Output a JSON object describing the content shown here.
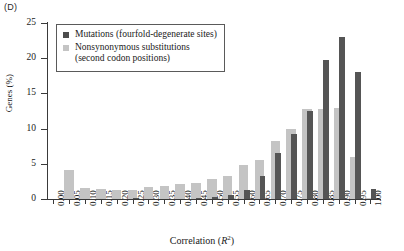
{
  "panel": {
    "label": "(D)"
  },
  "legend": {
    "items": [
      {
        "key": "mutations",
        "label": "Mutations (fourfold-degenerate sites)",
        "color": "#4d4d4d",
        "swatch": "square-swatch-icon"
      },
      {
        "key": "nonsynonymous",
        "label": "Nonsynonymous substitutions\n(second codon positions)",
        "color": "#c4c4c4",
        "swatch": "square-swatch-icon"
      }
    ]
  },
  "axes": {
    "y_ticks": [
      "0",
      "5",
      "10",
      "15",
      "20",
      "25"
    ],
    "x_ticks": [
      "0.00",
      "0.05",
      "0.10",
      "0.15",
      "0.20",
      "0.25",
      "0.30",
      "0.35",
      "0.40",
      "0.45",
      "0.50",
      "0.55",
      "0.60",
      "0.65",
      "0.70",
      "0.75",
      "0.80",
      "0.85",
      "0.90",
      "0.95",
      "1.00"
    ],
    "ylabel": "Genes (%)",
    "xlabel_prefix": "Correlation (",
    "xlabel_symbol": "R",
    "xlabel_exponent": "2",
    "xlabel_suffix": ")"
  },
  "chart_data": {
    "type": "bar",
    "title": "(D)",
    "xlabel": "Correlation (R2)",
    "ylabel": "Genes (%)",
    "ylim": [
      0,
      25
    ],
    "grid": false,
    "legend_position": "upper-left",
    "categories": [
      "0.00",
      "0.05",
      "0.10",
      "0.15",
      "0.20",
      "0.25",
      "0.30",
      "0.35",
      "0.40",
      "0.45",
      "0.50",
      "0.55",
      "0.60",
      "0.65",
      "0.70",
      "0.75",
      "0.80",
      "0.85",
      "0.90",
      "0.95",
      "1.00"
    ],
    "series": [
      {
        "name": "Nonsynonymous substitutions (second codon positions)",
        "color": "#c4c4c4",
        "values": [
          0.0,
          4.1,
          1.5,
          1.4,
          1.3,
          1.3,
          1.7,
          1.8,
          2.1,
          2.3,
          2.8,
          3.2,
          4.9,
          5.6,
          8.3,
          9.9,
          12.8,
          12.8,
          12.9,
          5.9,
          0.2
        ]
      },
      {
        "name": "Mutations (fourfold-degenerate sites)",
        "color": "#555555",
        "values": [
          0.0,
          0.0,
          0.0,
          0.0,
          0.0,
          0.1,
          0.0,
          0.0,
          0.0,
          0.1,
          0.3,
          0.5,
          1.3,
          3.2,
          6.6,
          9.2,
          12.5,
          19.7,
          23.0,
          18.1,
          1.4
        ]
      }
    ]
  }
}
